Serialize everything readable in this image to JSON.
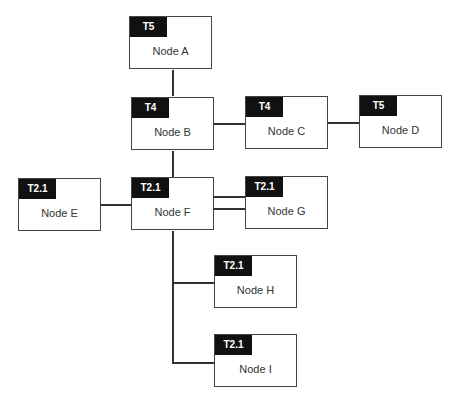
{
  "nodes": {
    "a": {
      "tag": "T5",
      "label": "Node A"
    },
    "b": {
      "tag": "T4",
      "label": "Node B"
    },
    "c": {
      "tag": "T4",
      "label": "Node C"
    },
    "d": {
      "tag": "T5",
      "label": "Node D"
    },
    "e": {
      "tag": "T2.1",
      "label": "Node E"
    },
    "f": {
      "tag": "T2.1",
      "label": "Node F"
    },
    "g": {
      "tag": "T2.1",
      "label": "Node G"
    },
    "h": {
      "tag": "T2.1",
      "label": "Node H"
    },
    "i": {
      "tag": "T2.1",
      "label": "Node I"
    }
  },
  "edges": [
    [
      "Node A",
      "Node B"
    ],
    [
      "Node B",
      "Node C"
    ],
    [
      "Node C",
      "Node D"
    ],
    [
      "Node B",
      "Node F"
    ],
    [
      "Node E",
      "Node F"
    ],
    [
      "Node F",
      "Node G",
      "double"
    ],
    [
      "Node F",
      "Node H"
    ],
    [
      "Node F",
      "Node I"
    ]
  ]
}
